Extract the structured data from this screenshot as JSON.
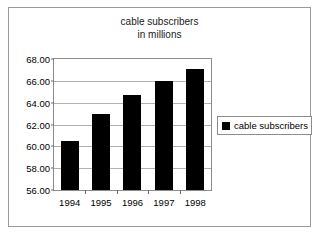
{
  "chart_data": {
    "type": "bar",
    "title": "cable subscribers in millions",
    "title_lines": [
      "cable subscribers",
      "in millions"
    ],
    "categories": [
      "1994",
      "1995",
      "1996",
      "1997",
      "1998"
    ],
    "values": [
      60.5,
      63.0,
      64.7,
      66.0,
      67.1
    ],
    "series": [
      {
        "name": "cable subscribers",
        "values": [
          60.5,
          63.0,
          64.7,
          66.0,
          67.1
        ],
        "color": "#000000"
      }
    ],
    "xlabel": "",
    "ylabel": "",
    "ylim": [
      56.0,
      68.0
    ],
    "ytick_step": 2.0,
    "ytick_labels": [
      "68.00",
      "66.00",
      "64.00",
      "62.00",
      "60.00",
      "58.00",
      "56.00"
    ],
    "ytick_values": [
      68.0,
      66.0,
      64.0,
      62.0,
      60.0,
      58.0,
      56.0
    ],
    "grid": true,
    "legend_position": "right",
    "legend_entries": [
      "cable subscribers"
    ]
  },
  "colors": {
    "bar": "#000000",
    "grid": "#b0b0b0",
    "axis": "#8c8c8c",
    "frame": "#9a9a9a",
    "background": "#ffffff",
    "text": "#000000"
  }
}
